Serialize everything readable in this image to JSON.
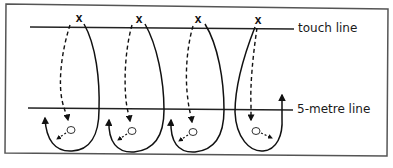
{
  "diagram": {
    "labels": {
      "touch_line": "touch line",
      "five_metre_line": "5-metre line"
    },
    "players": [
      {
        "marker": "x",
        "x": 79,
        "y": 18
      },
      {
        "marker": "x",
        "x": 139,
        "y": 19
      },
      {
        "marker": "x",
        "x": 198,
        "y": 19
      },
      {
        "marker": "x",
        "x": 258,
        "y": 20
      }
    ],
    "balls": [
      {
        "x": 71,
        "y": 130
      },
      {
        "x": 132,
        "y": 131
      },
      {
        "x": 193,
        "y": 132
      },
      {
        "x": 256,
        "y": 131
      }
    ],
    "legend_of_strokes": {
      "solid_line": "player run",
      "dashed_line": "ball path"
    },
    "colors": {
      "ink": "#111111",
      "border": "#555555",
      "background": "#ffffff"
    }
  }
}
